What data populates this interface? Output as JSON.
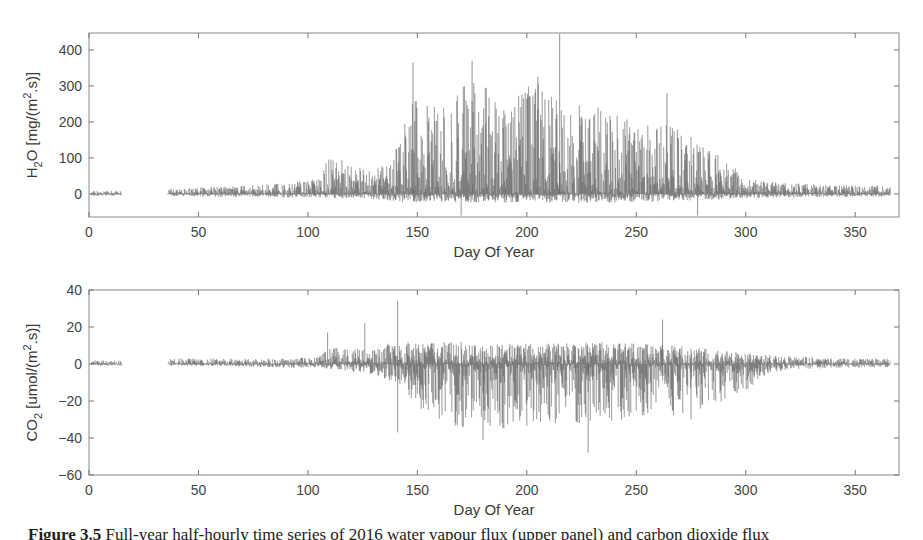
{
  "figure": {
    "caption_label": "Figure 3.5",
    "caption_text": " Full-year half-hourly time series of 2016 water vapour flux (upper panel) and carbon dioxide flux"
  },
  "chart_data": [
    {
      "type": "line",
      "title": "",
      "xlabel": "Day Of Year",
      "ylabel": "H2O [mg/(m2.s)]",
      "ylabel_parts": {
        "main": "H",
        "sub": "2",
        "rest": "O [mg/(m",
        "sup": "2",
        "end": ".s)]"
      },
      "xlim": [
        0,
        370
      ],
      "ylim": [
        -64,
        447
      ],
      "xticks": [
        0,
        50,
        100,
        150,
        200,
        250,
        300,
        350
      ],
      "yticks": [
        0,
        100,
        200,
        300,
        400
      ],
      "grid": false,
      "legend": null,
      "line_color": "#555555",
      "data_gaps": [
        [
          15,
          36
        ]
      ],
      "data_range_days": [
        1,
        366
      ],
      "envelope": {
        "description": "approximate upper/lower envelope of half-hourly flux by day of year",
        "day": [
          1,
          15,
          36,
          60,
          90,
          105,
          110,
          130,
          140,
          148,
          160,
          175,
          190,
          205,
          215,
          230,
          250,
          265,
          280,
          290,
          300,
          320,
          340,
          366
        ],
        "upper": [
          8,
          10,
          15,
          20,
          30,
          45,
          110,
          60,
          120,
          260,
          240,
          330,
          250,
          320,
          250,
          250,
          200,
          195,
          140,
          100,
          45,
          30,
          25,
          25
        ],
        "lower": [
          -5,
          -5,
          -6,
          -8,
          -10,
          -10,
          -12,
          -15,
          -20,
          -25,
          -25,
          -25,
          -25,
          -25,
          -25,
          -25,
          -25,
          -20,
          -18,
          -15,
          -12,
          -10,
          -8,
          -8
        ]
      },
      "notable_peaks": [
        {
          "day": 148,
          "value": 365
        },
        {
          "day": 175,
          "value": 370
        },
        {
          "day": 205,
          "value": 325
        },
        {
          "day": 215,
          "value": 445
        },
        {
          "day": 264,
          "value": 280
        },
        {
          "day": 170,
          "value": -60
        },
        {
          "day": 278,
          "value": -60
        }
      ]
    },
    {
      "type": "line",
      "title": "",
      "xlabel": "Day Of Year",
      "ylabel": "CO2 [umol/(m2.s)]",
      "ylabel_parts": {
        "main": "CO",
        "sub": "2",
        "rest": " [umol/(m",
        "sup": "2",
        "end": ".s)]"
      },
      "xlim": [
        0,
        370
      ],
      "ylim": [
        -60,
        40
      ],
      "xticks": [
        0,
        50,
        100,
        150,
        200,
        250,
        300,
        350
      ],
      "yticks": [
        -60,
        -40,
        -20,
        0,
        20,
        40
      ],
      "grid": false,
      "legend": null,
      "line_color": "#555555",
      "data_gaps": [
        [
          15,
          36
        ]
      ],
      "data_range_days": [
        1,
        366
      ],
      "envelope": {
        "description": "approximate upper/lower envelope of half-hourly flux by day of year",
        "day": [
          1,
          15,
          36,
          60,
          90,
          105,
          110,
          125,
          140,
          150,
          170,
          190,
          210,
          230,
          250,
          270,
          285,
          300,
          310,
          325,
          340,
          366
        ],
        "upper": [
          2,
          2,
          3,
          3,
          3,
          4,
          10,
          8,
          12,
          12,
          12,
          11,
          11,
          12,
          11,
          10,
          8,
          6,
          5,
          4,
          3,
          3
        ],
        "lower": [
          -1,
          -1,
          -1,
          -1,
          -2,
          -2,
          -3,
          -5,
          -10,
          -25,
          -35,
          -35,
          -33,
          -32,
          -30,
          -28,
          -22,
          -15,
          -5,
          -3,
          -2,
          -2
        ]
      },
      "notable_peaks": [
        {
          "day": 141,
          "value": 34
        },
        {
          "day": 109,
          "value": 17
        },
        {
          "day": 126,
          "value": 22
        },
        {
          "day": 141,
          "value": -37
        },
        {
          "day": 228,
          "value": -48
        },
        {
          "day": 262,
          "value": 24
        },
        {
          "day": 180,
          "value": -41
        },
        {
          "day": 275,
          "value": -30
        }
      ]
    }
  ]
}
